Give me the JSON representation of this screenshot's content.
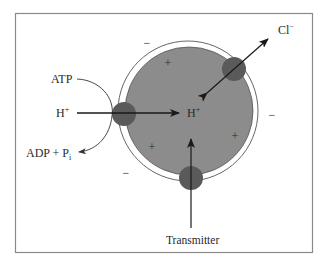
{
  "figure": {
    "frame_color": "#8a8a8a",
    "background": "#ffffff"
  },
  "vesicle": {
    "fill_color": "#8c8c8c",
    "membrane_color": "#ffffff",
    "outline_color": "#555555",
    "pump_color": "#5a5a5a",
    "inside_charges": [
      "+",
      "+",
      "+",
      "+"
    ],
    "outside_charges": [
      "−",
      "−",
      "−"
    ]
  },
  "labels": {
    "atp": "ATP",
    "h_plus_outside": "H",
    "h_plus_outside_sup": "+",
    "adp_pi": "ADP + P",
    "adp_pi_sub": "i",
    "h_plus_inside": "H",
    "h_plus_inside_sup": "+",
    "chloride": "Cl",
    "chloride_sup": "−",
    "transmitter": "Transmitter"
  },
  "arrows": {
    "proton_pump": {
      "from": "H+ (outside)",
      "to": "H+ (inside)"
    },
    "atp_hydrolysis": {
      "from": "ATP",
      "to": "ADP + Pi"
    },
    "chloride_channel": {
      "direction": "bidirectional",
      "between": "Cl- (outside)",
      "and": "vesicle interior"
    },
    "transmitter_transport": {
      "from": "Transmitter",
      "to": "vesicle interior"
    }
  }
}
